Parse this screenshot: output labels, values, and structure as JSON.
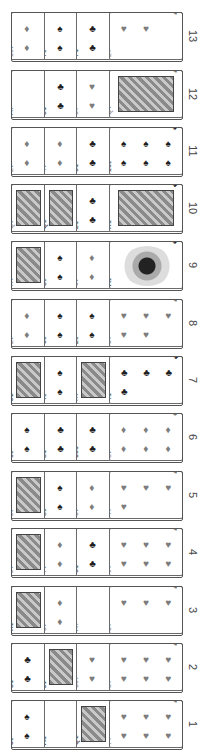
{
  "layout": {
    "orientation": "rotated-90-clockwise",
    "row_count": 13
  },
  "colors": {
    "red_suit": "#7d7d7d",
    "black_suit": "#1e1e1e",
    "card_border": "#6a6a6a",
    "label": "#444444"
  },
  "rows": [
    {
      "label": "13",
      "cards": [
        {
          "rank": "10",
          "suit": "♦"
        },
        {
          "rank": "7",
          "suit": "♠"
        },
        {
          "rank": "7",
          "suit": "♣"
        },
        {
          "rank": "2",
          "suit": "♥"
        }
      ]
    },
    {
      "label": "12",
      "cards": [
        {
          "rank": "A",
          "suit": "♦"
        },
        {
          "rank": "5",
          "suit": "♣"
        },
        {
          "rank": "6",
          "suit": "♥"
        },
        {
          "rank": "Q",
          "suit": "♥"
        }
      ]
    },
    {
      "label": "11",
      "cards": [
        {
          "rank": "2",
          "suit": "♦"
        },
        {
          "rank": "4",
          "suit": "♦"
        },
        {
          "rank": "6",
          "suit": "♣"
        },
        {
          "rank": "10",
          "suit": "♠"
        }
      ]
    },
    {
      "label": "10",
      "cards": [
        {
          "rank": "Q",
          "suit": "♦"
        },
        {
          "rank": "Q",
          "suit": "♣"
        },
        {
          "rank": "2",
          "suit": "♣"
        },
        {
          "rank": "K",
          "suit": "♣"
        }
      ]
    },
    {
      "label": "9",
      "cards": [
        {
          "rank": "K",
          "suit": "♥"
        },
        {
          "rank": "3",
          "suit": "♠"
        },
        {
          "rank": "5",
          "suit": "♦"
        },
        {
          "rank": "A",
          "suit": "♠"
        }
      ]
    },
    {
      "label": "8",
      "cards": [
        {
          "rank": "2",
          "suit": "♦"
        },
        {
          "rank": "6",
          "suit": "♠"
        },
        {
          "rank": "2",
          "suit": "♠"
        },
        {
          "rank": "5",
          "suit": "♥"
        }
      ]
    },
    {
      "label": "7",
      "cards": [
        {
          "rank": "J",
          "suit": "♣"
        },
        {
          "rank": "4",
          "suit": "♠"
        },
        {
          "rank": "K",
          "suit": "♦"
        },
        {
          "rank": "4",
          "suit": "♣"
        }
      ]
    },
    {
      "label": "6",
      "cards": [
        {
          "rank": "6",
          "suit": "♠"
        },
        {
          "rank": "8",
          "suit": "♣"
        },
        {
          "rank": "10",
          "suit": "♣"
        },
        {
          "rank": "8",
          "suit": "♦"
        }
      ]
    },
    {
      "label": "5",
      "cards": [
        {
          "rank": "J",
          "suit": "♦"
        },
        {
          "rank": "8",
          "suit": "♠"
        },
        {
          "rank": "5",
          "suit": "♦"
        },
        {
          "rank": "4",
          "suit": "♥"
        }
      ]
    },
    {
      "label": "4",
      "cards": [
        {
          "rank": "J",
          "suit": "♥"
        },
        {
          "rank": "7",
          "suit": "♦"
        },
        {
          "rank": "6",
          "suit": "♣"
        },
        {
          "rank": "9",
          "suit": "♥"
        }
      ]
    },
    {
      "label": "3",
      "cards": [
        {
          "rank": "K",
          "suit": "♠"
        },
        {
          "rank": "5",
          "suit": "♦"
        },
        {
          "rank": "A",
          "suit": "♥"
        },
        {
          "rank": "3",
          "suit": "♥"
        }
      ]
    },
    {
      "label": "2",
      "cards": [
        {
          "rank": "3",
          "suit": "♣"
        },
        {
          "rank": "J",
          "suit": "♠"
        },
        {
          "rank": "10",
          "suit": "♥"
        },
        {
          "rank": "8",
          "suit": "♥"
        }
      ]
    },
    {
      "label": "1",
      "cards": [
        {
          "rank": "5",
          "suit": "♠"
        },
        {
          "rank": "A",
          "suit": "♣"
        },
        {
          "rank": "Q",
          "suit": "♣"
        },
        {
          "rank": "7",
          "suit": "♥"
        }
      ]
    }
  ]
}
